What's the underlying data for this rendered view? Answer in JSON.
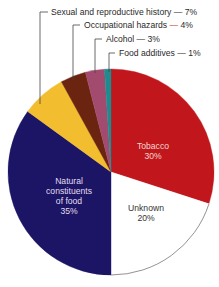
{
  "chart_data": {
    "type": "pie",
    "title": "",
    "start_angle_deg": 0,
    "direction": "clockwise",
    "slices": [
      {
        "label": "Tobacco",
        "value": 30,
        "display": "30%",
        "color": "#c0161c",
        "label_mode": "inside",
        "label_lines": [
          "Tobacco",
          "30%"
        ],
        "text_color": "#f4d6d0",
        "label_pos": [
          153,
          151
        ]
      },
      {
        "label": "Unknown",
        "value": 20,
        "display": "20%",
        "color": "#ffffff",
        "label_mode": "inside",
        "label_lines": [
          "Unknown",
          "20%"
        ],
        "text_color": "#333333",
        "label_pos": [
          146,
          213
        ]
      },
      {
        "label": "Natural constituents of food",
        "value": 35,
        "display": "35%",
        "color": "#1c1464",
        "label_mode": "inside",
        "label_lines": [
          "Natural",
          "constituents",
          "of food",
          "35%"
        ],
        "text_color": "#e0ddf0",
        "label_pos": [
          69,
          196
        ]
      },
      {
        "label": "Sexual and reproductive history",
        "value": 7,
        "display": "7%",
        "color": "#f2bd2f",
        "label_mode": "callout",
        "callout_text": "Sexual and reproductive history — 7%",
        "text_pos": [
          51,
          15
        ],
        "line": [
          [
            48,
            12
          ],
          [
            40,
            12
          ],
          [
            40,
            104
          ]
        ]
      },
      {
        "label": "Occupational hazards",
        "value": 4,
        "display": "4%",
        "color": "#6b2410",
        "label_mode": "callout",
        "callout_text_parts": [
          "Occupational hazards ",
          "—",
          " 4%"
        ],
        "dash_color": "#c0392b",
        "text_pos": [
          84,
          28
        ],
        "line": [
          [
            80,
            25
          ],
          [
            73,
            25
          ],
          [
            73,
            80
          ]
        ]
      },
      {
        "label": "Alcohol",
        "value": 3,
        "display": "3%",
        "color": "#a34a6f",
        "label_mode": "callout",
        "callout_text": "Alcohol — 3%",
        "text_pos": [
          106,
          42
        ],
        "line": [
          [
            102,
            39
          ],
          [
            95,
            39
          ],
          [
            95,
            73
          ]
        ]
      },
      {
        "label": "Food additives",
        "value": 1,
        "display": "1%",
        "color": "#1e8c8f",
        "label_mode": "callout",
        "callout_text": "Food additives — 1%",
        "text_pos": [
          119,
          56
        ],
        "line": [
          [
            115,
            53
          ],
          [
            109,
            53
          ],
          [
            109,
            72
          ]
        ]
      }
    ],
    "center": [
      111,
      172
    ],
    "radius": 103,
    "outline_color": "#777777",
    "legend": "none (callout labels)"
  }
}
